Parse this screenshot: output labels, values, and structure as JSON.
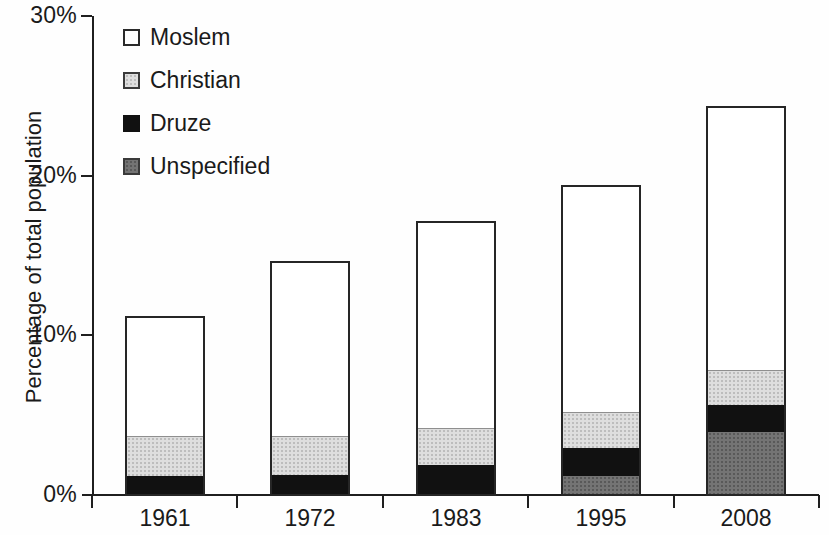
{
  "figure": {
    "background": "#fefefe",
    "axis_color": "#1f1f1f",
    "text_color": "#1a1a1a"
  },
  "y_axis": {
    "title": "Percentage of total population",
    "ticks": [
      {
        "label": "0%",
        "value": 0
      },
      {
        "label": "10%",
        "value": 10
      },
      {
        "label": "20%",
        "value": 20
      },
      {
        "label": "30%",
        "value": 30
      }
    ]
  },
  "x_axis": {
    "categories": [
      "1961",
      "1972",
      "1983",
      "1995",
      "2008"
    ]
  },
  "legend": {
    "position": "top-left",
    "items": [
      {
        "label": "Moslem",
        "key": "moslem",
        "fill": "#ffffff",
        "border": "#2a2a2a"
      },
      {
        "label": "Christian",
        "key": "christian",
        "fill": "#dedede",
        "border": "#3a3a3a"
      },
      {
        "label": "Druze",
        "key": "druze",
        "fill": "#111111",
        "border": "#111111"
      },
      {
        "label": "Unspecified",
        "key": "unspecified",
        "fill": "#747474",
        "border": "#3a3a3a"
      }
    ]
  },
  "chart_data": {
    "type": "bar",
    "stacked": true,
    "title": "",
    "xlabel": "",
    "ylabel": "Percentage of total population",
    "ylim": [
      0,
      30
    ],
    "grid": false,
    "legend_position": "top-left",
    "categories": [
      "1961",
      "1972",
      "1983",
      "1995",
      "2008"
    ],
    "stack_order_bottom_to_top": [
      "Unspecified",
      "Druze",
      "Christian",
      "Moslem"
    ],
    "series": [
      {
        "name": "Moslem",
        "key": "moslem",
        "color": "#ffffff",
        "values": [
          7.7,
          11.1,
          13.1,
          14.4,
          16.7
        ]
      },
      {
        "name": "Christian",
        "key": "christian",
        "color": "#dedede",
        "values": [
          2.5,
          2.4,
          2.3,
          2.2,
          2.1
        ]
      },
      {
        "name": "Druze",
        "key": "druze",
        "color": "#111111",
        "values": [
          1.1,
          1.2,
          1.8,
          1.8,
          1.7
        ]
      },
      {
        "name": "Unspecified",
        "key": "unspecified",
        "color": "#747474",
        "values": [
          0,
          0,
          0,
          1.1,
          3.9
        ]
      }
    ],
    "totals": [
      11.3,
      14.7,
      17.2,
      19.5,
      24.4
    ]
  }
}
